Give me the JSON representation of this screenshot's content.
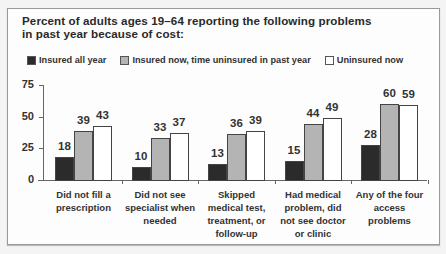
{
  "chart_data": {
    "type": "bar",
    "title": "Percent of adults ages 19–64 reporting the following problems in past year because of cost:",
    "title_lines": [
      "Percent of adults ages 19–64 reporting the following problems",
      "in past year because of cost:"
    ],
    "xlabel": "",
    "ylabel": "",
    "ylim": [
      0,
      75
    ],
    "yticks": [
      "0",
      "25",
      "50",
      "75"
    ],
    "grid": false,
    "legend_position": "top",
    "categories": [
      [
        "Did not fill a",
        "prescription"
      ],
      [
        "Did not see",
        "specialist when",
        "needed"
      ],
      [
        "Skipped",
        "medical test,",
        "treatment, or",
        "follow-up"
      ],
      [
        "Had medical",
        "problem, did",
        "not see doctor",
        "or clinic"
      ],
      [
        "Any of the four",
        "access",
        "problems"
      ]
    ],
    "series": [
      {
        "name": "Insured all year",
        "color": "#2b2b2b",
        "values": [
          18,
          10,
          13,
          15,
          28
        ]
      },
      {
        "name": "Insured now, time uninsured in past year",
        "color": "#b4b4b4",
        "values": [
          39,
          33,
          36,
          44,
          60
        ]
      },
      {
        "name": "Uninsured now",
        "color": "#ffffff",
        "values": [
          43,
          37,
          39,
          49,
          59
        ]
      }
    ]
  }
}
